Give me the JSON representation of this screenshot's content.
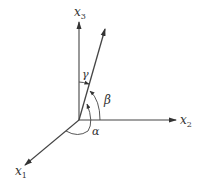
{
  "diagram": {
    "type": "3d-direction-angles",
    "axes": {
      "x1": {
        "label": "x",
        "subscript": "1"
      },
      "x2": {
        "label": "x",
        "subscript": "2"
      },
      "x3": {
        "label": "x",
        "subscript": "3"
      }
    },
    "angles": {
      "alpha": "α",
      "beta": "β",
      "gamma": "γ"
    },
    "colors": {
      "line": "#444444",
      "text": "#333333",
      "background": "#ffffff"
    }
  }
}
